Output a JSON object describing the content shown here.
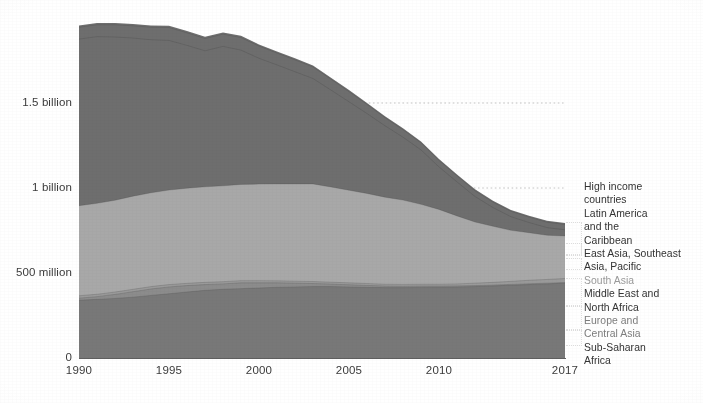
{
  "chart_data": {
    "type": "area",
    "stacked": true,
    "title": "",
    "subtitle": "",
    "xlabel": "",
    "ylabel": "",
    "grid": true,
    "grid_style": "dotted-horizontal",
    "legend_position": "right",
    "xlim": [
      1990,
      2017
    ],
    "ylim": [
      0,
      1900000000
    ],
    "x_tick_labels": [
      "1990",
      "1995",
      "2000",
      "2005",
      "2010",
      "2017"
    ],
    "x_ticks": [
      1990,
      1995,
      2000,
      2005,
      2010,
      2017
    ],
    "y_tick_labels": [
      "1.5 billion",
      "1 billion",
      "500 million",
      "0"
    ],
    "y_ticks": [
      1500000000,
      1000000000,
      500000000,
      0
    ],
    "x": [
      1990,
      1991,
      1992,
      1993,
      1994,
      1995,
      1996,
      1997,
      1998,
      1999,
      2000,
      2001,
      2002,
      2003,
      2004,
      2005,
      2006,
      2007,
      2008,
      2009,
      2010,
      2011,
      2012,
      2013,
      2014,
      2015,
      2016,
      2017
    ],
    "series": [
      {
        "name": "Sub-Saharan Africa",
        "color": "#787878",
        "order": 1,
        "values": [
          340000000,
          345000000,
          350000000,
          358000000,
          368000000,
          378000000,
          388000000,
          398000000,
          404000000,
          408000000,
          412000000,
          416000000,
          418000000,
          420000000,
          420000000,
          418000000,
          416000000,
          414000000,
          414000000,
          415000000,
          416000000,
          418000000,
          420000000,
          424000000,
          428000000,
          432000000,
          436000000,
          440000000
        ]
      },
      {
        "name": "Europe and Central Asia",
        "color": "#8c8c8c",
        "order": 2,
        "values": [
          12000000,
          16000000,
          24000000,
          32000000,
          38000000,
          40000000,
          38000000,
          34000000,
          32000000,
          34000000,
          30000000,
          26000000,
          22000000,
          18000000,
          15000000,
          13000000,
          11000000,
          9000000,
          8000000,
          8000000,
          7000000,
          6000000,
          6000000,
          5000000,
          5000000,
          5000000,
          4000000,
          4000000
        ]
      },
      {
        "name": "Middle East and North Africa",
        "color": "#9a9a9a",
        "order": 3,
        "values": [
          14000000,
          14000000,
          14000000,
          14000000,
          14000000,
          14000000,
          13000000,
          13000000,
          13000000,
          13000000,
          13000000,
          12000000,
          12000000,
          12000000,
          11000000,
          11000000,
          11000000,
          11000000,
          11000000,
          11000000,
          11000000,
          12000000,
          14000000,
          16000000,
          18000000,
          20000000,
          22000000,
          24000000
        ]
      },
      {
        "name": "South Asia",
        "color": "#a8a8a8",
        "order": 4,
        "values": [
          530000000,
          535000000,
          540000000,
          548000000,
          552000000,
          556000000,
          560000000,
          562000000,
          564000000,
          566000000,
          568000000,
          570000000,
          572000000,
          574000000,
          560000000,
          545000000,
          530000000,
          512000000,
          496000000,
          470000000,
          440000000,
          400000000,
          360000000,
          330000000,
          300000000,
          280000000,
          260000000,
          250000000
        ]
      },
      {
        "name": "East Asia, Southeast Asia, Pacific",
        "color": "#6e6e6e",
        "order": 5,
        "values": [
          980000000,
          980000000,
          960000000,
          930000000,
          900000000,
          880000000,
          840000000,
          800000000,
          820000000,
          790000000,
          740000000,
          700000000,
          660000000,
          620000000,
          570000000,
          520000000,
          470000000,
          420000000,
          370000000,
          320000000,
          250000000,
          200000000,
          150000000,
          110000000,
          80000000,
          60000000,
          45000000,
          36000000
        ]
      },
      {
        "name": "Latin America and the Caribbean",
        "color": "#6e6e6e",
        "order": 6,
        "values": [
          70000000,
          70000000,
          72000000,
          72000000,
          74000000,
          76000000,
          74000000,
          72000000,
          72000000,
          74000000,
          72000000,
          70000000,
          70000000,
          68000000,
          64000000,
          60000000,
          54000000,
          48000000,
          44000000,
          42000000,
          38000000,
          36000000,
          34000000,
          32000000,
          32000000,
          32000000,
          32000000,
          32000000
        ]
      },
      {
        "name": "High income countries",
        "color": "#6e6e6e",
        "order": 7,
        "values": [
          10000000,
          10000000,
          10000000,
          10000000,
          10000000,
          10000000,
          10000000,
          10000000,
          10000000,
          10000000,
          9000000,
          9000000,
          9000000,
          9000000,
          9000000,
          9000000,
          8000000,
          8000000,
          8000000,
          8000000,
          8000000,
          8000000,
          8000000,
          8000000,
          8000000,
          8000000,
          8000000,
          8000000
        ]
      }
    ],
    "totals": [
      1956000000,
      1970000000,
      1970000000,
      1964000000,
      1956000000,
      1954000000,
      1923000000,
      1889000000,
      1915000000,
      1895000000,
      1844000000,
      1803000000,
      1763000000,
      1721000000,
      1649000000,
      1576000000,
      1500000000,
      1422000000,
      1351000000,
      1274000000,
      1170000000,
      1080000000,
      992000000,
      925000000,
      871000000,
      837000000,
      807000000,
      794000000
    ]
  },
  "axis": {
    "y_labels": [
      {
        "text": "1.5 billion",
        "value": 1500000000
      },
      {
        "text": "1 billion",
        "value": 1000000000
      },
      {
        "text": "500 million",
        "value": 500000000
      },
      {
        "text": "0",
        "value": 0
      }
    ],
    "x_labels": [
      {
        "text": "1990",
        "value": 1990
      },
      {
        "text": "1995",
        "value": 1995
      },
      {
        "text": "2000",
        "value": 2000
      },
      {
        "text": "2005",
        "value": 2005
      },
      {
        "text": "2010",
        "value": 2010
      },
      {
        "text": "2017",
        "value": 2017
      }
    ]
  },
  "legend": {
    "entries": [
      {
        "label": "High income\ncountries",
        "tone": "dark"
      },
      {
        "label": "Latin America\nand the\nCaribbean",
        "tone": "dark"
      },
      {
        "label": "East Asia, Southeast\n Asia, Pacific",
        "tone": "dark"
      },
      {
        "label": "South Asia",
        "tone": "faint"
      },
      {
        "label": "Middle East and\nNorth Africa",
        "tone": "dark"
      },
      {
        "label": "Europe and\nCentral Asia",
        "tone": "semi"
      },
      {
        "label": "Sub-Saharan\nAfrica",
        "tone": "dark"
      }
    ]
  },
  "colors": {
    "band_dark": "#6e6e6e",
    "band_light": "#a8a8a8",
    "band_mid": "#8c8c8c",
    "band_bottom": "#787878",
    "axis": "#5f5f5f",
    "text": "#3b3b3b",
    "gridline": "#bdbdbd",
    "background": "#ffffff"
  }
}
